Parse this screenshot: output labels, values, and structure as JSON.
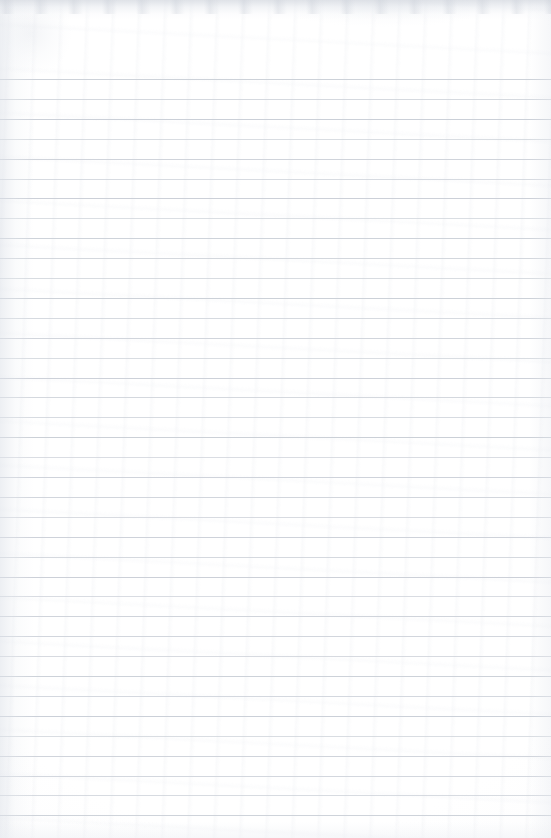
{
  "document": {
    "kind": "scanned-ruled-notebook-page",
    "title": "Blank ruled notebook page",
    "width": 551,
    "height": 838,
    "text_content": "",
    "handwriting_present": "no",
    "printed_text_present": "no"
  },
  "paper": {
    "background_color": "#ffffff",
    "tint_color": "#f9fafb",
    "edge_shadow_color": "#d6dae1",
    "texture": "faint scanner grain and mottling",
    "orientation": "portrait"
  },
  "ruling": {
    "style": "horizontal ruled lines",
    "line_color": "#c9ced6",
    "line_thickness_px": 1,
    "first_line_y": 79,
    "line_spacing_px": 19.9,
    "line_count": 38,
    "left_inset_px": 0,
    "right_inset_px": 0,
    "top_margin_px": 79,
    "margin_rule_present": "no",
    "line_opacities": [
      0.92,
      0.78,
      0.96,
      0.7,
      0.88,
      0.74,
      0.95,
      0.68,
      0.9,
      0.82,
      0.72,
      0.94,
      0.76,
      0.86,
      0.7,
      0.93,
      0.8,
      0.74,
      0.97,
      0.69,
      0.89,
      0.84,
      0.73,
      0.91,
      0.77,
      0.95,
      0.71,
      0.87,
      0.83,
      0.75,
      0.92,
      0.79,
      0.96,
      0.7,
      0.88,
      0.81,
      0.74,
      0.9
    ]
  }
}
